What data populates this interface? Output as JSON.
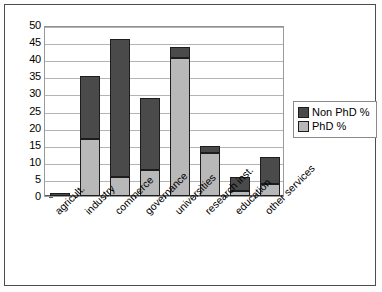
{
  "chart_data": {
    "type": "bar",
    "subtype": "stacked",
    "title": "",
    "xlabel": "",
    "ylabel": "",
    "ylim": [
      0,
      50
    ],
    "yticks": [
      0,
      5,
      10,
      15,
      20,
      25,
      30,
      35,
      40,
      45,
      50
    ],
    "grid": true,
    "legend_position": "right",
    "categories": [
      "agricult.",
      "industry",
      "commerce",
      "governance",
      "universities",
      "research inst.",
      "education",
      "other services"
    ],
    "series": [
      {
        "name": "PhD %",
        "color": "#b8b8b8",
        "values": [
          0,
          16.7,
          5.5,
          7.5,
          40.5,
          12.5,
          1.5,
          3.4
        ]
      },
      {
        "name": "Non PhD %",
        "color": "#4a4a4a",
        "values": [
          0.8,
          18.3,
          40.3,
          21.3,
          3.2,
          2.1,
          4.0,
          8.0
        ]
      }
    ],
    "totals": [
      0.8,
      35.0,
      45.8,
      28.8,
      43.7,
      14.6,
      5.5,
      11.4
    ]
  },
  "legend": {
    "items": [
      {
        "label": "Non PhD %",
        "swatch": "dark-gray"
      },
      {
        "label": "PhD %",
        "swatch": "light-gray"
      }
    ]
  },
  "axis": {
    "y_labels": [
      "50",
      "45",
      "40",
      "35",
      "30",
      "25",
      "20",
      "15",
      "10",
      "5",
      "0"
    ]
  },
  "colors": {
    "non_phd": "#4a4a4a",
    "phd": "#b8b8b8",
    "gridline": "#b4b4b4",
    "axis": "#5a5a5a",
    "frame": "#4d4d4d"
  }
}
